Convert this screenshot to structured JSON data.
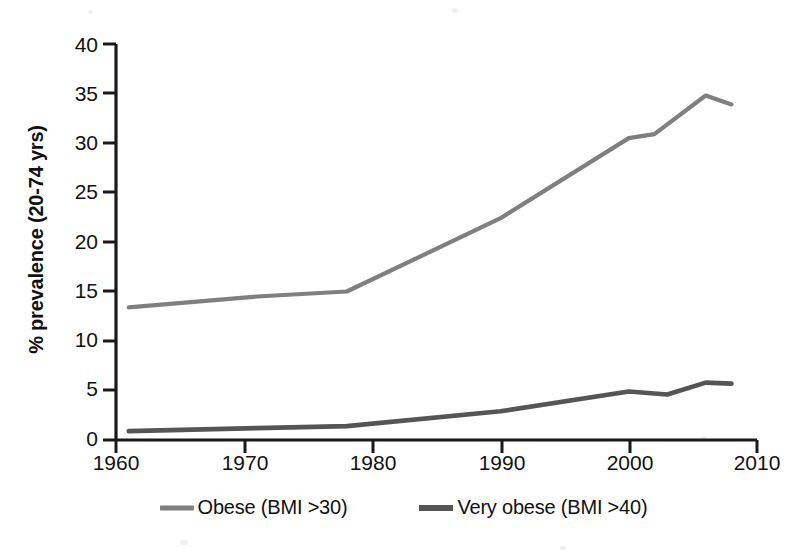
{
  "chart_data": {
    "type": "line",
    "title": "",
    "xlabel": "",
    "ylabel": "% prevalence (20-74 yrs)",
    "xlim": [
      1960,
      2010
    ],
    "ylim": [
      0,
      40
    ],
    "xticks": [
      1960,
      1970,
      1980,
      1990,
      2000,
      2010
    ],
    "yticks": [
      0,
      5,
      10,
      15,
      20,
      25,
      30,
      35,
      40
    ],
    "grid": false,
    "legend_position": "bottom",
    "series": [
      {
        "name": "Obese (BMI >30)",
        "color": "#7f7f7f",
        "x": [
          1961,
          1971,
          1978,
          1990,
          2000,
          2002,
          2006,
          2008
        ],
        "values": [
          13.4,
          14.5,
          15.0,
          22.4,
          30.5,
          30.9,
          34.8,
          33.9
        ]
      },
      {
        "name": "Very obese (BMI >40)",
        "color": "#555555",
        "x": [
          1961,
          1971,
          1978,
          1990,
          2000,
          2003,
          2006,
          2008
        ],
        "values": [
          0.9,
          1.2,
          1.4,
          2.9,
          4.9,
          4.6,
          5.8,
          5.7
        ]
      }
    ]
  },
  "legend": {
    "items": [
      {
        "label": "Obese (BMI >30)",
        "color": "#7f7f7f"
      },
      {
        "label": "Very obese (BMI >40)",
        "color": "#555555"
      }
    ]
  },
  "axis": {
    "y_title": "% prevalence (20-74 yrs)",
    "y_tick_labels": [
      "40",
      "35",
      "30",
      "25",
      "20",
      "15",
      "10",
      "5",
      "0"
    ],
    "x_tick_labels": [
      "1960",
      "1970",
      "1980",
      "1990",
      "2000",
      "2010"
    ]
  }
}
